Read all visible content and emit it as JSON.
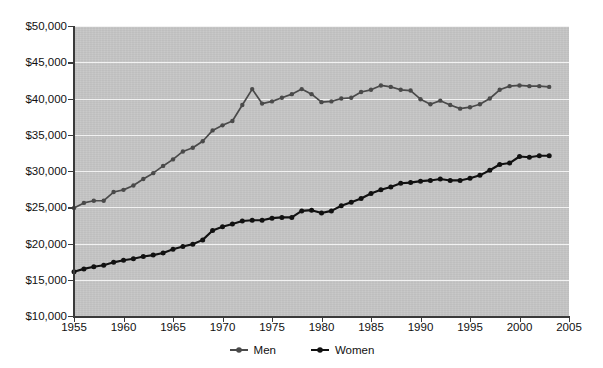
{
  "chart_data": {
    "type": "line",
    "title": "",
    "subtitle": "",
    "xlabel": "",
    "ylabel": "",
    "xlim": [
      1955,
      2005
    ],
    "ylim": [
      10000,
      50000
    ],
    "grid": true,
    "legend_position": "bottom-center",
    "x_tick_labels": [
      "1955",
      "1960",
      "1965",
      "1970",
      "1975",
      "1980",
      "1985",
      "1990",
      "1995",
      "2000",
      "2005"
    ],
    "x_ticks": [
      1955,
      1960,
      1965,
      1970,
      1975,
      1980,
      1985,
      1990,
      1995,
      2000,
      2005
    ],
    "y_tick_labels": [
      "$10,000",
      "$15,000",
      "$20,000",
      "$25,000",
      "$30,000",
      "$35,000",
      "$40,000",
      "$45,000",
      "$50,000"
    ],
    "y_ticks": [
      10000,
      15000,
      20000,
      25000,
      30000,
      35000,
      40000,
      45000,
      50000
    ],
    "x": [
      1955,
      1956,
      1957,
      1958,
      1959,
      1960,
      1961,
      1962,
      1963,
      1964,
      1965,
      1966,
      1967,
      1968,
      1969,
      1970,
      1971,
      1972,
      1973,
      1974,
      1975,
      1976,
      1977,
      1978,
      1979,
      1980,
      1981,
      1982,
      1983,
      1984,
      1985,
      1986,
      1987,
      1988,
      1989,
      1990,
      1991,
      1992,
      1993,
      1994,
      1995,
      1996,
      1997,
      1998,
      1999,
      2000,
      2001,
      2002,
      2003
    ],
    "series": [
      {
        "name": "Men",
        "color": "#4a4a4a",
        "marker": "circle",
        "values": [
          24900,
          25600,
          25900,
          25900,
          27100,
          27400,
          28000,
          28900,
          29700,
          30700,
          31600,
          32700,
          33200,
          34100,
          35600,
          36300,
          36900,
          39100,
          41300,
          39300,
          39600,
          40100,
          40600,
          41300,
          40600,
          39500,
          39600,
          40000,
          40100,
          40900,
          41200,
          41800,
          41600,
          41200,
          41100,
          39900,
          39200,
          39700,
          39100,
          38600,
          38800,
          39200,
          40000,
          41200,
          41700,
          41800,
          41700,
          41700,
          41600
        ]
      },
      {
        "name": "Women",
        "color": "#111111",
        "marker": "circle",
        "values": [
          16100,
          16500,
          16800,
          17000,
          17400,
          17700,
          17900,
          18200,
          18400,
          18700,
          19200,
          19600,
          19900,
          20500,
          21800,
          22300,
          22700,
          23100,
          23200,
          23200,
          23500,
          23600,
          23600,
          24500,
          24600,
          24200,
          24500,
          25200,
          25700,
          26200,
          26900,
          27400,
          27800,
          28300,
          28400,
          28600,
          28700,
          28900,
          28700,
          28700,
          29000,
          29400,
          30100,
          30900,
          31100,
          32000,
          31900,
          32100,
          32100
        ]
      }
    ]
  },
  "legend": {
    "items": [
      {
        "label": "Men",
        "color": "#4a4a4a"
      },
      {
        "label": "Women",
        "color": "#111111"
      }
    ]
  },
  "style": {
    "plot_background": "#c5c5c5",
    "gridline_color": "#f2f2f2",
    "axis_color": "#3a3a3a",
    "page_background": "#ffffff"
  }
}
